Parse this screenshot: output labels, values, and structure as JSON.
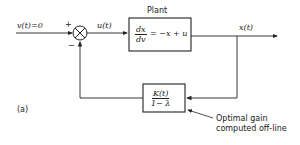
{
  "diagram": {
    "input_label": "v(t)=0",
    "plus_sign": "+",
    "minus_sign": "−",
    "control_label": "u(t)",
    "plant": {
      "title": "Plant",
      "eq_num": "dx",
      "eq_den": "dv",
      "eq_rhs": "= −x + u"
    },
    "output_label": "x(t)",
    "gain_block": {
      "num": "K(t)",
      "den": "1− λ"
    },
    "annotation_line1": "Optimal gain",
    "annotation_line2": "computed off-line",
    "panel_label": "(a)"
  }
}
